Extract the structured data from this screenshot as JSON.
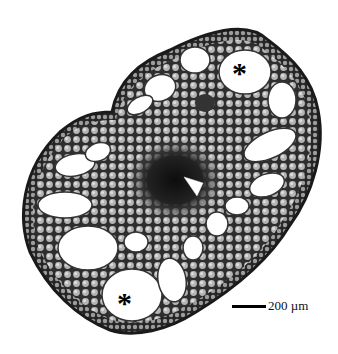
{
  "figure": {
    "annotations": {
      "air_space_marker_1": "*",
      "air_space_marker_2": "*",
      "arrowhead": "white arrowhead pointing to central stele"
    },
    "scale_bar": {
      "value": "200",
      "unit": "µm",
      "label": "200  µm"
    },
    "colors": {
      "tissue_dark": "#2a2a2a",
      "cell_wall": "#3c3c3c",
      "cell_fill": "#b8b8b8",
      "air_space": "#ffffff",
      "background": "#ffffff"
    }
  }
}
